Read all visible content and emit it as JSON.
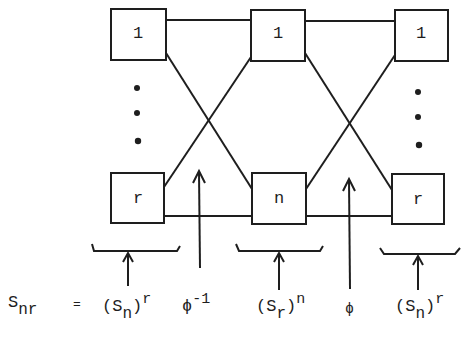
{
  "diagram": {
    "top_row": [
      {
        "label": "1"
      },
      {
        "label": "1"
      },
      {
        "label": "1"
      }
    ],
    "bottom_row": [
      {
        "label": "r"
      },
      {
        "label": "n"
      },
      {
        "label": "r"
      }
    ],
    "ellipsis": "⋮",
    "formula": {
      "lhs": "S",
      "lhs_sub": "nr",
      "equals": "=",
      "terms": [
        {
          "base": "(S",
          "sub": "n",
          "close": ")",
          "sup": "r"
        },
        {
          "symbol": "ϕ",
          "sup": "-1"
        },
        {
          "base": "(S",
          "sub": "r",
          "close": ")",
          "sup": "n"
        },
        {
          "symbol": "ϕ"
        },
        {
          "base": "(S",
          "sub": "n",
          "close": ")",
          "sup": "r"
        }
      ]
    }
  }
}
